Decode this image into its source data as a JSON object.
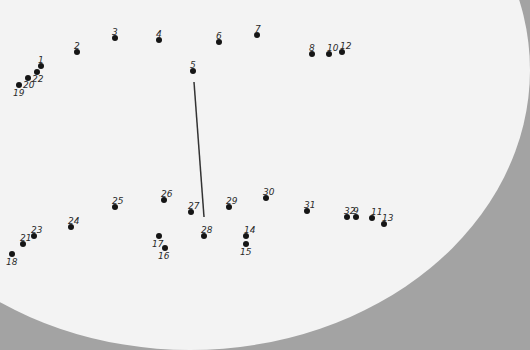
{
  "puzzle": {
    "type": "connect-the-dots",
    "colors": {
      "dot": "#151515",
      "label": "#2a2a2a",
      "paper": "#f3f3f3",
      "surround": "#a3a3a3",
      "line": "#333333"
    },
    "dots": [
      {
        "n": "1",
        "x": 41,
        "y": 66,
        "lx": 38,
        "ly": 56
      },
      {
        "n": "2",
        "x": 77,
        "y": 52,
        "lx": 74,
        "ly": 42
      },
      {
        "n": "3",
        "x": 115,
        "y": 38,
        "lx": 112,
        "ly": 28
      },
      {
        "n": "4",
        "x": 159,
        "y": 40,
        "lx": 156,
        "ly": 30
      },
      {
        "n": "5",
        "x": 193,
        "y": 71,
        "lx": 190,
        "ly": 61
      },
      {
        "n": "6",
        "x": 219,
        "y": 42,
        "lx": 216,
        "ly": 32
      },
      {
        "n": "7",
        "x": 257,
        "y": 35,
        "lx": 255,
        "ly": 25
      },
      {
        "n": "8",
        "x": 312,
        "y": 54,
        "lx": 309,
        "ly": 44
      },
      {
        "n": "9",
        "x": 356,
        "y": 217,
        "lx": 353,
        "ly": 207
      },
      {
        "n": "10",
        "x": 329,
        "y": 54,
        "lx": 327,
        "ly": 44
      },
      {
        "n": "11",
        "x": 372,
        "y": 218,
        "lx": 371,
        "ly": 208
      },
      {
        "n": "12",
        "x": 342,
        "y": 52,
        "lx": 340,
        "ly": 42
      },
      {
        "n": "13",
        "x": 384,
        "y": 224,
        "lx": 382,
        "ly": 214
      },
      {
        "n": "14",
        "x": 246,
        "y": 236,
        "lx": 244,
        "ly": 226
      },
      {
        "n": "15",
        "x": 246,
        "y": 244,
        "lx": 240,
        "ly": 248
      },
      {
        "n": "16",
        "x": 165,
        "y": 248,
        "lx": 158,
        "ly": 252
      },
      {
        "n": "17",
        "x": 159,
        "y": 236,
        "lx": 152,
        "ly": 240
      },
      {
        "n": "18",
        "x": 12,
        "y": 254,
        "lx": 6,
        "ly": 258
      },
      {
        "n": "19",
        "x": 19,
        "y": 85,
        "lx": 13,
        "ly": 89
      },
      {
        "n": "20",
        "x": 28,
        "y": 78,
        "lx": 23,
        "ly": 81
      },
      {
        "n": "21",
        "x": 23,
        "y": 244,
        "lx": 20,
        "ly": 234
      },
      {
        "n": "22",
        "x": 37,
        "y": 72,
        "lx": 32,
        "ly": 75
      },
      {
        "n": "23",
        "x": 34,
        "y": 236,
        "lx": 31,
        "ly": 226
      },
      {
        "n": "24",
        "x": 71,
        "y": 227,
        "lx": 68,
        "ly": 217
      },
      {
        "n": "25",
        "x": 115,
        "y": 207,
        "lx": 112,
        "ly": 197
      },
      {
        "n": "26",
        "x": 164,
        "y": 200,
        "lx": 161,
        "ly": 190
      },
      {
        "n": "27",
        "x": 191,
        "y": 212,
        "lx": 188,
        "ly": 202
      },
      {
        "n": "28",
        "x": 204,
        "y": 236,
        "lx": 201,
        "ly": 226
      },
      {
        "n": "29",
        "x": 229,
        "y": 207,
        "lx": 226,
        "ly": 197
      },
      {
        "n": "30",
        "x": 266,
        "y": 198,
        "lx": 263,
        "ly": 188
      },
      {
        "n": "31",
        "x": 307,
        "y": 211,
        "lx": 304,
        "ly": 201
      },
      {
        "n": "32",
        "x": 347,
        "y": 217,
        "lx": 344,
        "ly": 207
      }
    ],
    "drawn_lines": [
      {
        "x1": 194,
        "y1": 82,
        "x2": 204,
        "y2": 217
      }
    ]
  }
}
